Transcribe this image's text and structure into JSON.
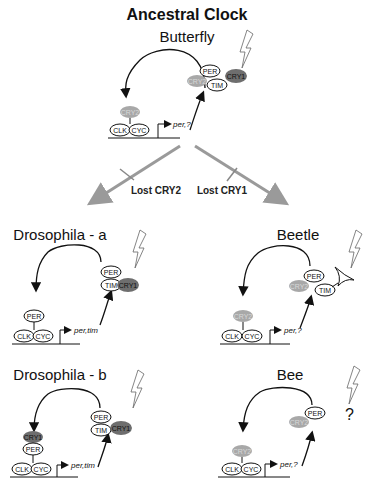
{
  "title": "Ancestral Clock",
  "colors": {
    "cry1": "#6e6e6e",
    "cry2": "#a8a8a8",
    "branch_arrow": "#9a9a9a",
    "line": "#111111"
  },
  "branches": {
    "left": "Lost CRY2",
    "right": "Lost CRY1"
  },
  "panels": {
    "butterfly": {
      "label": "Butterfly",
      "nucleus": [
        "CRY2",
        "CLK",
        "CYC"
      ],
      "cytoplasm": [
        "PER",
        "CRY2",
        "TIM",
        "CRY1"
      ],
      "genes": "per,?",
      "light": "lightning-icon"
    },
    "drosophila_a": {
      "label": "Drosophila - a",
      "nucleus": [
        "PER",
        "CLK",
        "CYC"
      ],
      "cytoplasm": [
        "PER",
        "TIM",
        "CRY1"
      ],
      "genes": "per,tim",
      "light": "lightning-icon"
    },
    "beetle": {
      "label": "Beetle",
      "nucleus": [
        "CRY2",
        "CLK",
        "CYC"
      ],
      "cytoplasm": [
        "PER",
        "CRY2",
        "TIM",
        "photoreceptor"
      ],
      "genes": "per,?",
      "light": "lightning-icon"
    },
    "drosophila_b": {
      "label": "Drosophila - b",
      "nucleus": [
        "CRY1",
        "PER",
        "CLK",
        "CYC"
      ],
      "cytoplasm": [
        "PER",
        "TIM",
        "CRY1"
      ],
      "genes": "per,tim",
      "light": "lightning-icon"
    },
    "bee": {
      "label": "Bee",
      "nucleus": [
        "CRY2",
        "CLK",
        "CYC"
      ],
      "cytoplasm": [
        "PER",
        "CRY2"
      ],
      "genes": "per,?",
      "light": "lightning-icon",
      "unknown": "?"
    }
  }
}
